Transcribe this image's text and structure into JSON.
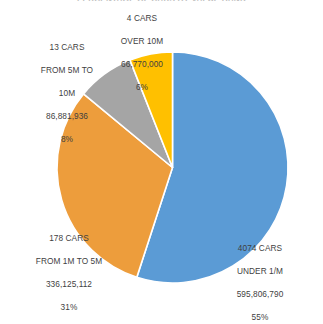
{
  "chart_data": {
    "type": "pie",
    "title": "PERCENTAGE OF CARS BY VALUE BAND",
    "categories": [
      "UNDER 1/M",
      "FROM 1M TO 5M",
      "FROM 5M TO 10M",
      "OVER 10M"
    ],
    "values": [
      55,
      31,
      8,
      6
    ],
    "amounts": [
      595806790,
      336125112,
      86881936,
      66770000
    ],
    "counts": [
      4074,
      178,
      13,
      4
    ],
    "colors": [
      "#5B9BD5",
      "#ED9D3C",
      "#A5A5A5",
      "#FFC000"
    ],
    "start_angle_deg": 0,
    "direction": "clockwise",
    "legend": "none",
    "grid": false,
    "xlabel": "",
    "ylabel": "",
    "slice_separator_color": "#FFFFFF",
    "labels_position": "outside",
    "slices": [
      {
        "name": "under-1m",
        "count_line": "4074 CARS",
        "range_line": "UNDER 1/M",
        "amount_line": "595,806,790",
        "percent_line": "55%",
        "color": "#5B9BD5",
        "percent": 55
      },
      {
        "name": "1m-to-5m",
        "count_line": "178 CARS",
        "range_line": "FROM 1M TO 5M",
        "amount_line": "336,125,112",
        "percent_line": "31%",
        "color": "#ED9D3C",
        "percent": 31
      },
      {
        "name": "5m-to-10m",
        "count_line": "13 CARS",
        "range_line_a": "FROM 5M TO",
        "range_line_b": "10M",
        "amount_line": "86,881,936",
        "percent_line": "8%",
        "color": "#A5A5A5",
        "percent": 8
      },
      {
        "name": "over-10m",
        "count_line": "4 CARS",
        "range_line": "OVER 10M",
        "amount_line": "66,770,000",
        "percent_line": "6%",
        "color": "#FFC000",
        "percent": 6
      }
    ]
  }
}
